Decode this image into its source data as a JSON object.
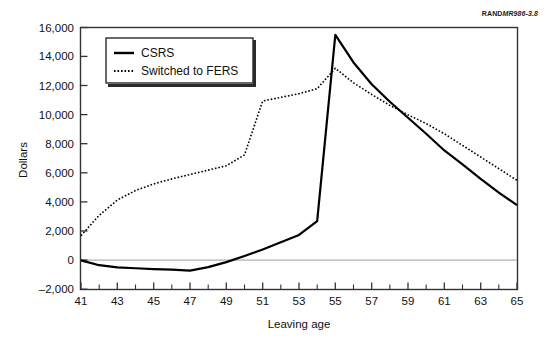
{
  "figure": {
    "source_tag_brand": "RAND",
    "source_tag_number": "MR986-3.8"
  },
  "chart_data": {
    "type": "line",
    "title": "",
    "xlabel": "Leaving age",
    "ylabel": "Dollars",
    "xlim": [
      41,
      65
    ],
    "ylim": [
      -2000,
      16000
    ],
    "xticks": [
      41,
      43,
      45,
      47,
      49,
      51,
      53,
      55,
      57,
      59,
      61,
      63,
      65
    ],
    "xticklabels": [
      "41",
      "43",
      "45",
      "47",
      "49",
      "51",
      "53",
      "55",
      "57",
      "59",
      "61",
      "63",
      "65"
    ],
    "xminorticks": [
      42,
      44,
      46,
      48,
      50,
      52,
      54,
      56,
      58,
      60,
      62,
      64
    ],
    "yticks": [
      -2000,
      0,
      2000,
      4000,
      6000,
      8000,
      10000,
      12000,
      14000,
      16000
    ],
    "yticklabels": [
      "–2,000",
      "0",
      "2,000",
      "4,000",
      "6,000",
      "8,000",
      "10,000",
      "12,000",
      "14,000",
      "16,000"
    ],
    "grid": false,
    "zero_line": 0,
    "legend_position": "upper left",
    "x": [
      41,
      42,
      43,
      44,
      45,
      46,
      47,
      48,
      49,
      50,
      51,
      52,
      53,
      54,
      55,
      56,
      57,
      58,
      59,
      60,
      61,
      62,
      63,
      64,
      65
    ],
    "series": [
      {
        "name": "CSRS",
        "style": "solid",
        "color": "#000000",
        "values": [
          0,
          -330,
          -480,
          -540,
          -600,
          -640,
          -700,
          -460,
          -120,
          300,
          750,
          1250,
          1750,
          2700,
          15500,
          13600,
          12100,
          10900,
          9800,
          8700,
          7550,
          6600,
          5600,
          4650,
          3800
        ]
      },
      {
        "name": "Switched to FERS",
        "style": "dotted",
        "color": "#000000",
        "values": [
          1700,
          3100,
          4150,
          4800,
          5250,
          5600,
          5900,
          6200,
          6500,
          7250,
          10950,
          11200,
          11450,
          11800,
          13200,
          12200,
          11400,
          10650,
          10000,
          9400,
          8700,
          7900,
          7100,
          6300,
          5500
        ]
      }
    ]
  },
  "legend": {
    "items": [
      {
        "label": "CSRS",
        "style": "solid"
      },
      {
        "label": "Switched to FERS",
        "style": "dotted"
      }
    ]
  }
}
